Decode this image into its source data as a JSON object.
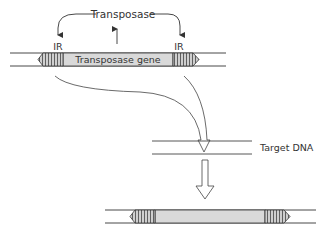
{
  "diagram": {
    "title_label": "Transposase",
    "gene_label": "Transposase gene",
    "ir_left_label": "IR",
    "ir_right_label": "IR",
    "target_label": "Target DNA"
  },
  "colors": {
    "stroke": "#333333",
    "gene_fill": "#d9d9d9",
    "ir_fill": "#c8c8c8",
    "background": "#ffffff"
  }
}
